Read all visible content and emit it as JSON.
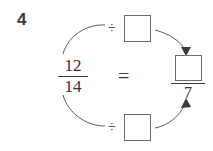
{
  "problem": {
    "number": "4",
    "type": "equivalent-fraction-division"
  },
  "left_fraction": {
    "numerator": "12",
    "denominator": "14"
  },
  "relation": {
    "equals": "="
  },
  "answer_fraction": {
    "numerator": "",
    "numerator_placeholder": "",
    "denominator": "7"
  },
  "operators": {
    "divide_top": "÷",
    "divide_bottom": "÷"
  },
  "answer_boxes": {
    "top": "",
    "bottom": "",
    "numerator": ""
  },
  "arrows": {
    "top_left_label": "",
    "top_right_label": "",
    "bottom_left_label": "",
    "bottom_right_label": ""
  },
  "colors": {
    "ink": "#333333",
    "box_border": "#6d6d6d",
    "arrow": "#5c5c5c",
    "background": "#ffffff"
  }
}
